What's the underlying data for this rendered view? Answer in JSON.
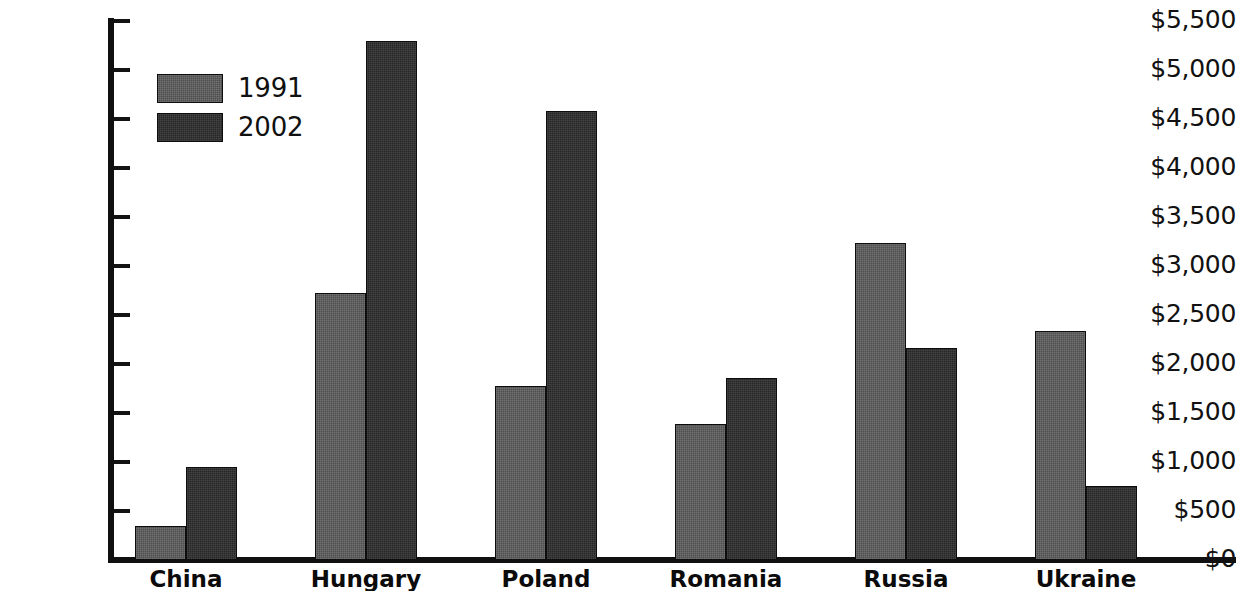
{
  "chart_data": {
    "type": "bar",
    "title": "",
    "xlabel": "",
    "ylabel": "",
    "categories": [
      "China",
      "Hungary",
      "Poland",
      "Romania",
      "Russia",
      "Ukraine"
    ],
    "series": [
      {
        "name": "1991",
        "color": "#4e4e4e",
        "values": [
          350,
          2720,
          1780,
          1390,
          3230,
          2340
        ]
      },
      {
        "name": "2002",
        "color": "#262626",
        "values": [
          950,
          5300,
          4580,
          1860,
          2160,
          760
        ]
      }
    ],
    "ylim": [
      0,
      5500
    ],
    "ytick_values": [
      0,
      500,
      1000,
      1500,
      2000,
      2500,
      3000,
      3500,
      4000,
      4500,
      5000,
      5500
    ],
    "ytick_labels": [
      "$0",
      "$500",
      "$1,000",
      "$1,500",
      "$2,000",
      "$2,500",
      "$3,000",
      "$3,500",
      "$4,000",
      "$4,500",
      "$5,000",
      "$5,500"
    ],
    "grid": false,
    "legend_position": "top-left",
    "legend_entries": [
      "1991",
      "2002"
    ]
  }
}
